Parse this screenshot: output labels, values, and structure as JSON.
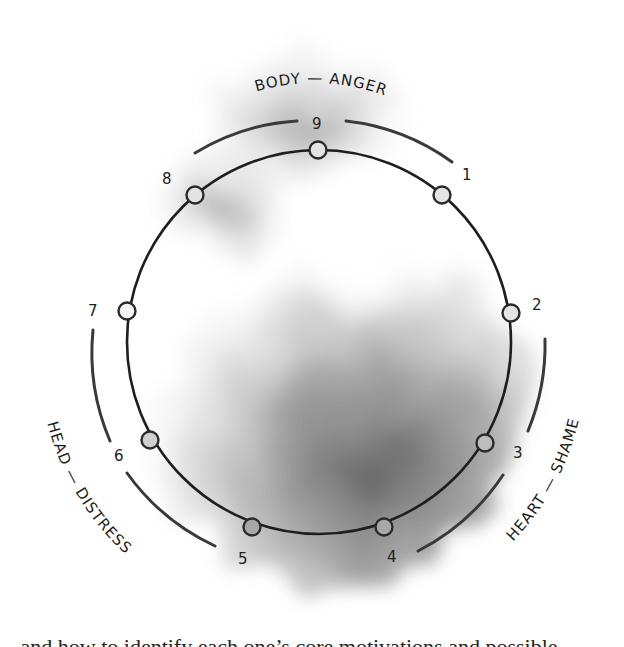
{
  "diagram": {
    "triads": [
      {
        "label": "BODY — ANGER",
        "points": [
          8,
          9,
          1
        ]
      },
      {
        "label": "HEART — SHAME",
        "points": [
          2,
          3,
          4
        ]
      },
      {
        "label": "HEAD — DISTRESS",
        "points": [
          5,
          6,
          7
        ]
      }
    ],
    "points": [
      {
        "label": "9"
      },
      {
        "label": "1"
      },
      {
        "label": "2"
      },
      {
        "label": "3"
      },
      {
        "label": "4"
      },
      {
        "label": "5"
      },
      {
        "label": "6"
      },
      {
        "label": "7"
      },
      {
        "label": "8"
      }
    ],
    "colors": {
      "line": "#1e1e1e",
      "wash_dark": "#6e6e6e",
      "wash_light": "#d8d8d8",
      "background": "#ffffff"
    }
  },
  "footer": {
    "clipped_text": "...and how to identify each one’s core motivations and possible ..."
  }
}
